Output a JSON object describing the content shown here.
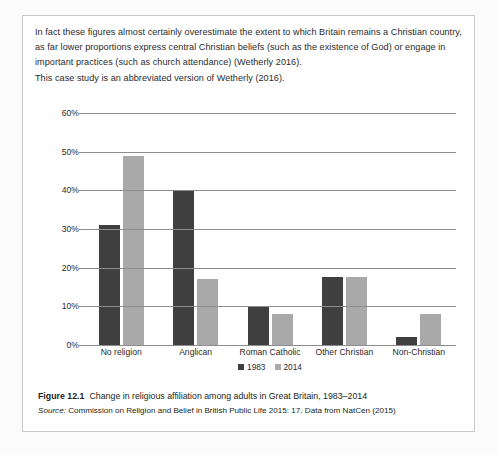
{
  "document": {
    "intro_paragraphs": [
      "In fact these figures almost certainly overestimate the extent to which Britain remains a Christian country, as far lower proportions express central Christian beliefs (such as the existence of God) or engage in important practices (such as church attendance) (Wetherly 2016).",
      "This case study is an abbreviated version of Wetherly (2016)."
    ],
    "caption": {
      "figure_number": "Figure 12.1",
      "title": "Change in religious affiliation among adults in Great Britain, 1983–2014",
      "source_label": "Source:",
      "source_text": "Commission on Religion and Belief in British Public Life 2015: 17. Data from NatCen (2015)"
    }
  },
  "chart_data": {
    "type": "bar",
    "title": "",
    "xlabel": "",
    "ylabel": "",
    "ylim": [
      0,
      60
    ],
    "yticks": [
      0,
      10,
      20,
      30,
      40,
      50,
      60
    ],
    "ytick_labels": [
      "0%",
      "10%",
      "20%",
      "30%",
      "40%",
      "50%",
      "60%"
    ],
    "grid": true,
    "legend_position": "bottom",
    "categories": [
      "No religion",
      "Anglican",
      "Roman Catholic",
      "Other Christian",
      "Non-Christian"
    ],
    "series": [
      {
        "name": "1983",
        "color": "#3f3f3f",
        "values": [
          31,
          40,
          10,
          17.5,
          2
        ]
      },
      {
        "name": "2014",
        "color": "#a9a9a9",
        "values": [
          49,
          17,
          8,
          17.5,
          8
        ]
      }
    ]
  },
  "colors": {
    "series_1983": "#3f3f3f",
    "series_2014": "#a9a9a9",
    "gridline": "#8d8d8d",
    "box_border": "#c9c9c9",
    "text": "#231f20"
  }
}
